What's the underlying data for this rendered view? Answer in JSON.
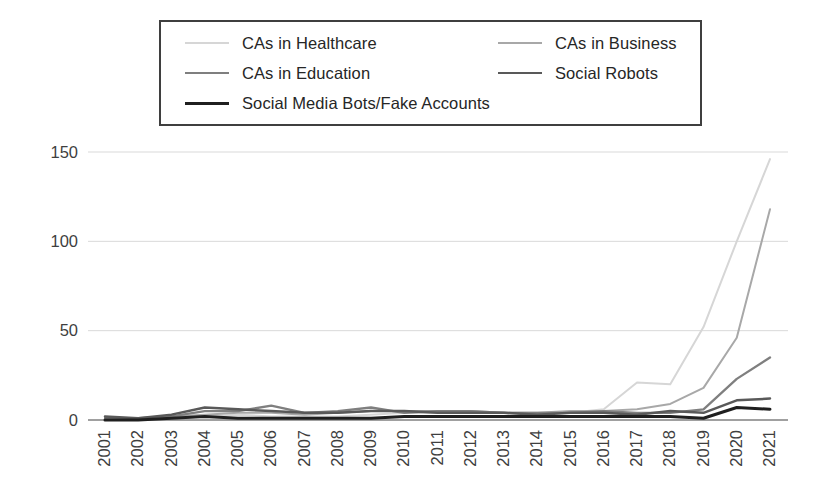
{
  "chart_data": {
    "type": "line",
    "title": "",
    "xlabel": "",
    "ylabel": "",
    "x_categories": [
      "2001",
      "2002",
      "2003",
      "2004",
      "2005",
      "2006",
      "2007",
      "2008",
      "2009",
      "2010",
      "2011",
      "2012",
      "2013",
      "2014",
      "2015",
      "2016",
      "2017",
      "2018",
      "2019",
      "2020",
      "2021"
    ],
    "ylim": [
      0,
      150
    ],
    "yticks": [
      "0",
      "50",
      "100",
      "150"
    ],
    "grid": "horizontal-only",
    "legend_position": "top-inside-border-box",
    "colors": {
      "axis_text": "#3f3f3f",
      "gridline": "#d9d9d9",
      "axis_line": "#808080",
      "legend_border": "#3f3f3f",
      "background": "#ffffff"
    },
    "series": [
      {
        "name": "CAs in Healthcare",
        "color": "#d6d6d6",
        "width": 2,
        "values": [
          1,
          1,
          1,
          2,
          3,
          2,
          2,
          2,
          3,
          4,
          4,
          4,
          4,
          3,
          4,
          6,
          21,
          20,
          52,
          100,
          146
        ]
      },
      {
        "name": "CAs in Business",
        "color": "#a8a8a8",
        "width": 2,
        "values": [
          1,
          1,
          2,
          3,
          4,
          4,
          3,
          4,
          5,
          5,
          5,
          5,
          4,
          4,
          5,
          5,
          6,
          9,
          18,
          46,
          118
        ]
      },
      {
        "name": "CAs in Education",
        "color": "#7f7f7f",
        "width": 2.3,
        "values": [
          1,
          1,
          2,
          5,
          5,
          8,
          4,
          5,
          7,
          4,
          5,
          5,
          4,
          4,
          4,
          5,
          4,
          4,
          6,
          23,
          35
        ]
      },
      {
        "name": "Social Robots",
        "color": "#595959",
        "width": 2.5,
        "values": [
          2,
          1,
          3,
          7,
          6,
          5,
          4,
          4,
          5,
          5,
          4,
          4,
          4,
          3,
          4,
          4,
          3,
          5,
          4,
          11,
          12
        ]
      },
      {
        "name": "Social Media Bots/Fake Accounts",
        "color": "#1f1f1f",
        "width": 3,
        "values": [
          0,
          0,
          1,
          2,
          1,
          1,
          1,
          1,
          1,
          2,
          2,
          2,
          2,
          2,
          2,
          2,
          2,
          2,
          1,
          7,
          6
        ]
      }
    ]
  }
}
